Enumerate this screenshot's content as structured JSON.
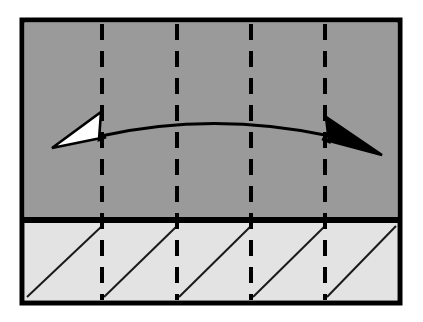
{
  "figure": {
    "title": "Cross-section diagram with double-headed span arrow",
    "type": "technical-line-diagram",
    "canvas": {
      "width": 423,
      "height": 322,
      "background": "#ffffff"
    }
  },
  "frame": {
    "name": "outer-border",
    "x": 22,
    "y": 20,
    "width": 378,
    "height": 283,
    "stroke": "#000000",
    "stroke_width": 5
  },
  "regions": [
    {
      "id": "upper-region",
      "label": "upper-layer",
      "fill": "#9a9a9a",
      "x": 25,
      "y": 23,
      "width": 372,
      "height": 195
    },
    {
      "id": "lower-region",
      "label": "lower-hatched-layer",
      "fill": "#e3e3e3",
      "x": 25,
      "y": 223,
      "width": 372,
      "height": 77
    }
  ],
  "divider": {
    "name": "horizontal-divider",
    "y": 220,
    "x1": 22,
    "x2": 400,
    "stroke": "#000000",
    "stroke_width": 6
  },
  "dashed_lines": {
    "name": "vertical-dashed-gridlines",
    "count": 4,
    "positions_x": [
      102,
      177,
      251,
      325
    ],
    "y_top": 24,
    "y_bottom": 300,
    "stroke": "#000000",
    "stroke_width": 4,
    "dash_pattern": "16 11"
  },
  "hatch_cells": {
    "name": "diagonal-hatch-marks",
    "count": 5,
    "stroke": "#1a1a1a",
    "stroke_width": 2,
    "direction": "bottom-left-to-top-right",
    "segments": [
      {
        "x1": 27,
        "y1": 297,
        "x2": 102,
        "y2": 226
      },
      {
        "x1": 104,
        "y1": 297,
        "x2": 177,
        "y2": 226
      },
      {
        "x1": 179,
        "y1": 297,
        "x2": 251,
        "y2": 226
      },
      {
        "x1": 253,
        "y1": 297,
        "x2": 325,
        "y2": 226
      },
      {
        "x1": 327,
        "y1": 297,
        "x2": 396,
        "y2": 226
      }
    ]
  },
  "span_arrow": {
    "name": "double-headed-span-arrow",
    "stroke": "#000000",
    "stroke_width": 3.2,
    "curve": {
      "start_x": 101,
      "start_y": 136,
      "control_x": 213,
      "control_y": 111,
      "end_x": 330,
      "end_y": 136
    },
    "heads": [
      {
        "id": "left-head",
        "direction": "left",
        "fill": "#ffffff",
        "stroke": "#000000",
        "tip_x": 52,
        "tip_y": 148,
        "points": "52,148 101,112 99,140 106,137"
      },
      {
        "id": "right-head",
        "direction": "right",
        "fill": "#000000",
        "stroke": "#000000",
        "tip_x": 382,
        "tip_y": 155,
        "points": "382,155 326,117 329,142 322,139"
      }
    ]
  }
}
